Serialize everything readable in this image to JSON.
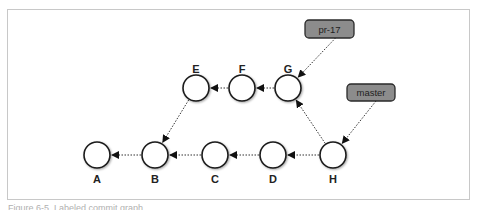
{
  "diagram": {
    "type": "git-commit-graph",
    "nodes": [
      {
        "id": "A",
        "label": "A",
        "cx": 97,
        "cy": 155,
        "label_y": 183
      },
      {
        "id": "B",
        "label": "B",
        "cx": 155,
        "cy": 155,
        "label_y": 183
      },
      {
        "id": "C",
        "label": "C",
        "cx": 215,
        "cy": 155,
        "label_y": 183
      },
      {
        "id": "D",
        "label": "D",
        "cx": 273,
        "cy": 155,
        "label_y": 183
      },
      {
        "id": "H",
        "label": "H",
        "cx": 333,
        "cy": 155,
        "label_y": 183
      },
      {
        "id": "E",
        "label": "E",
        "cx": 196,
        "cy": 88,
        "label_y": 73
      },
      {
        "id": "F",
        "label": "F",
        "cx": 242,
        "cy": 88,
        "label_y": 73
      },
      {
        "id": "G",
        "label": "G",
        "cx": 288,
        "cy": 88,
        "label_y": 73
      }
    ],
    "edges": [
      {
        "from": "B",
        "to": "A"
      },
      {
        "from": "C",
        "to": "B"
      },
      {
        "from": "D",
        "to": "C"
      },
      {
        "from": "H",
        "to": "D"
      },
      {
        "from": "H",
        "to": "G"
      },
      {
        "from": "G",
        "to": "F"
      },
      {
        "from": "F",
        "to": "E"
      },
      {
        "from": "E",
        "to": "B"
      }
    ],
    "refs": [
      {
        "id": "pr-17",
        "label": "pr-17",
        "x": 305,
        "y": 20,
        "w": 49,
        "h": 18,
        "points_to": "G"
      },
      {
        "id": "master",
        "label": "master",
        "x": 347,
        "y": 84,
        "w": 48,
        "h": 17,
        "points_to": "H"
      }
    ],
    "colors": {
      "node_fill": "#ffffff",
      "node_stroke": "#1a1a1a",
      "ref_fill": "#8c8c8c",
      "ref_stroke": "#2a2a2a",
      "edge": "#333333",
      "frame": "#c8c8c8"
    }
  },
  "caption": "Figure 6-5. Labeled commit graph"
}
